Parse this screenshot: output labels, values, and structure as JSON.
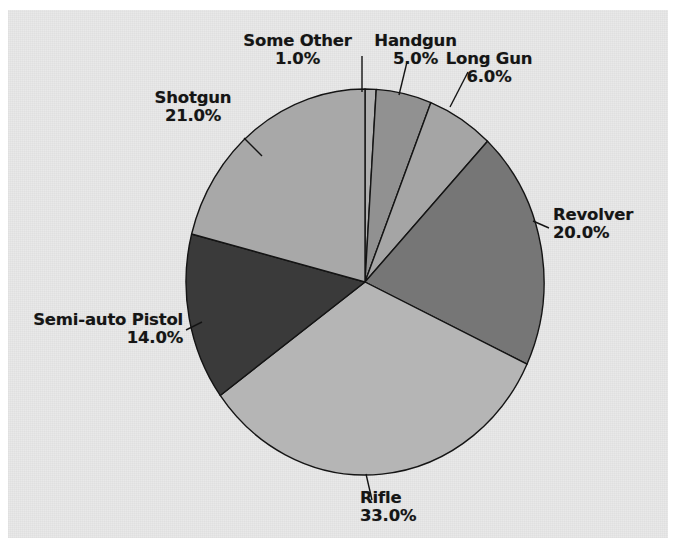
{
  "figure": {
    "background_color": "#e9e9e9",
    "page_color": "#ffffff",
    "outline_color": "#141414",
    "label_color": "#151515"
  },
  "chart_data": {
    "type": "pie",
    "title": "",
    "xlabel": "",
    "ylabel": "",
    "grid": false,
    "legend_position": "none",
    "labels_outside": true,
    "value_format": "percent_one_decimal",
    "total_percent": 100.0,
    "start_angle_deg": 90,
    "direction": "clockwise",
    "categories": [
      "Some Other",
      "Handgun",
      "Long Gun",
      "Revolver",
      "Rifle",
      "Semi-auto Pistol",
      "Shotgun"
    ],
    "values": [
      1.0,
      5.0,
      6.0,
      20.0,
      33.0,
      14.0,
      21.0
    ],
    "colors": [
      "#b0b0b0",
      "#919191",
      "#a5a5a5",
      "#767676",
      "#b5b5b5",
      "#3a3a3a",
      "#a8a8a8"
    ],
    "slices": [
      {
        "label": "Some Other",
        "value": 1.0,
        "display_value": "1.0%",
        "color": "#b0b0b0"
      },
      {
        "label": "Handgun",
        "value": 5.0,
        "display_value": "5.0%",
        "color": "#919191"
      },
      {
        "label": "Long Gun",
        "value": 6.0,
        "display_value": "6.0%",
        "color": "#a5a5a5"
      },
      {
        "label": "Revolver",
        "value": 20.0,
        "display_value": "20.0%",
        "color": "#767676"
      },
      {
        "label": "Rifle",
        "value": 33.0,
        "display_value": "33.0%",
        "color": "#b5b5b5"
      },
      {
        "label": "Semi-auto Pistol",
        "value": 14.0,
        "display_value": "14.0%",
        "color": "#3a3a3a"
      },
      {
        "label": "Shotgun",
        "value": 21.0,
        "display_value": "21.0%",
        "color": "#a8a8a8"
      }
    ]
  },
  "labels": {
    "some_other": {
      "name": "Some Other",
      "pct": "1.0%"
    },
    "handgun": {
      "name": "Handgun",
      "pct": "5.0%"
    },
    "long_gun": {
      "name": "Long Gun",
      "pct": "6.0%"
    },
    "revolver": {
      "name": "Revolver",
      "pct": "20.0%"
    },
    "rifle": {
      "name": "Rifle",
      "pct": "33.0%"
    },
    "semi_auto_pistol": {
      "name": "Semi-auto Pistol",
      "pct": "14.0%"
    },
    "shotgun": {
      "name": "Shotgun",
      "pct": "21.0%"
    }
  }
}
